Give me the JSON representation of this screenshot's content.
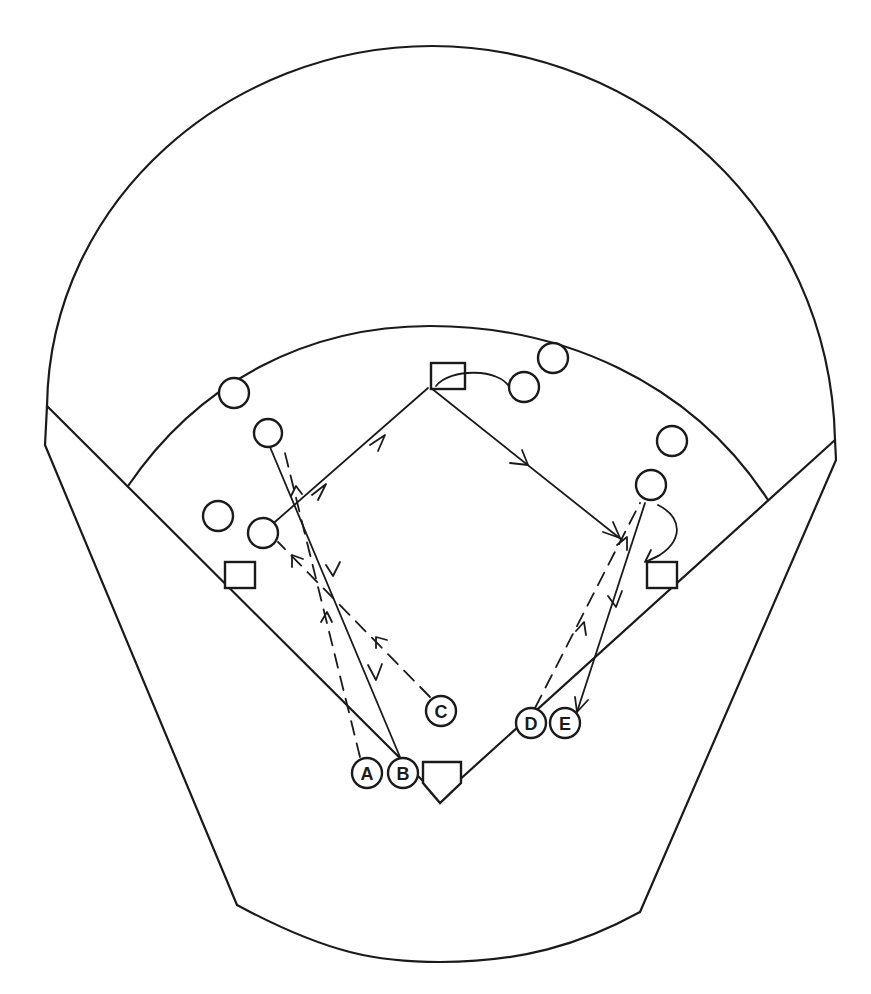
{
  "diagram": {
    "type": "baseball-field-drill",
    "colors": {
      "line": "#1a1a1a",
      "background": "#ffffff"
    },
    "labeled_players": [
      {
        "id": "A",
        "label": "A"
      },
      {
        "id": "B",
        "label": "B"
      },
      {
        "id": "C",
        "label": "C"
      },
      {
        "id": "D",
        "label": "D"
      },
      {
        "id": "E",
        "label": "E"
      }
    ],
    "bases": [
      "home-plate",
      "first-base",
      "second-base",
      "third-base"
    ],
    "unlabeled_fielders": 9,
    "line_legend": {
      "solid_arrow": "ball / throw path",
      "dashed_arrow": "player movement"
    }
  }
}
